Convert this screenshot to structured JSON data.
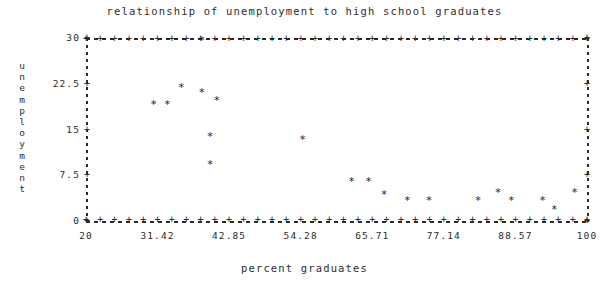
{
  "chart_data": {
    "type": "scatter",
    "title": "relationship of unemployment to high school graduates",
    "xlabel": "percent graduates",
    "ylabel": "unemployment",
    "marker": "*",
    "grid": false,
    "legend": null,
    "xlim": [
      20,
      100
    ],
    "ylim": [
      0,
      30
    ],
    "xticks": [
      "20",
      "31.42",
      "42.85",
      "54.28",
      "65.71",
      "77.14",
      "88.57",
      "100"
    ],
    "xtick_values": [
      20,
      31.42,
      42.85,
      54.28,
      65.71,
      77.14,
      88.57,
      100
    ],
    "yticks": [
      "30",
      "22.5",
      "15",
      "7.5",
      "0"
    ],
    "ytick_values": [
      30,
      22.5,
      15,
      7.5,
      0
    ],
    "points": [
      {
        "x": 30.8,
        "y": 19.1
      },
      {
        "x": 33.0,
        "y": 19.1
      },
      {
        "x": 35.2,
        "y": 22.0
      },
      {
        "x": 38.5,
        "y": 29.6
      },
      {
        "x": 38.5,
        "y": 21.2
      },
      {
        "x": 40.9,
        "y": 19.9
      },
      {
        "x": 39.8,
        "y": 14.0
      },
      {
        "x": 39.8,
        "y": 9.4
      },
      {
        "x": 54.6,
        "y": 13.4
      },
      {
        "x": 62.4,
        "y": 6.6
      },
      {
        "x": 65.1,
        "y": 6.6
      },
      {
        "x": 67.6,
        "y": 4.4
      },
      {
        "x": 71.3,
        "y": 3.4
      },
      {
        "x": 74.8,
        "y": 3.4
      },
      {
        "x": 82.6,
        "y": 3.4
      },
      {
        "x": 85.8,
        "y": 4.7
      },
      {
        "x": 87.9,
        "y": 3.4
      },
      {
        "x": 92.9,
        "y": 3.4
      },
      {
        "x": 94.8,
        "y": 1.9
      },
      {
        "x": 98.0,
        "y": 4.7
      }
    ]
  },
  "axis_title_chars": {
    "y": [
      "u",
      "n",
      "e",
      "m",
      "p",
      "l",
      "o",
      "y",
      "m",
      "e",
      "n",
      "t"
    ]
  },
  "style": {
    "ink": "#2b2b2b",
    "background": "#ffffff"
  }
}
